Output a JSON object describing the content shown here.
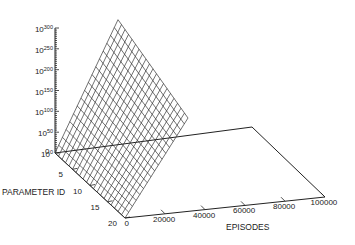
{
  "chart_data": {
    "type": "surface3d",
    "title": "",
    "xlabel": "EPISODES",
    "ylabel": "PARAMETER ID",
    "zlabel": "",
    "z_scale": "log",
    "x_ticks": [
      "0",
      "20000",
      "40000",
      "60000",
      "80000",
      "100000"
    ],
    "y_ticks": [
      "0",
      "5",
      "10",
      "15",
      "20"
    ],
    "z_ticks": [
      {
        "base": "10",
        "exp": "0"
      },
      {
        "base": "10",
        "exp": "50"
      },
      {
        "base": "10",
        "exp": "100"
      },
      {
        "base": "10",
        "exp": "150"
      },
      {
        "base": "10",
        "exp": "200"
      },
      {
        "base": "10",
        "exp": "250"
      },
      {
        "base": "10",
        "exp": "300"
      }
    ],
    "xlim": [
      0,
      100000
    ],
    "ylim": [
      0,
      20
    ],
    "zlim_log10": [
      0,
      300
    ],
    "grid": false,
    "legend": "none",
    "surface": {
      "description": "Wireframe mesh plane, log10(z) increasing with episodes and decreasing with parameter id",
      "mesh_lines_param": 21,
      "mesh_lines_episodes": 18,
      "corners_log10z": {
        "param0_ep0": 0,
        "param20_ep0": 0,
        "param0_ep_max": 300,
        "param20_ep_max": 220
      }
    }
  }
}
